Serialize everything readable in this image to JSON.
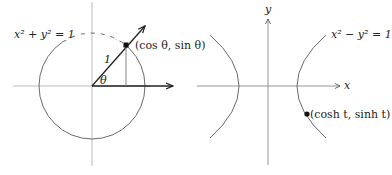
{
  "left_figure": {
    "circle_equation": "x² + y² = 1",
    "radius_label": "1",
    "angle_label": "θ",
    "point_label": "(cos θ, sin θ)"
  },
  "right_figure": {
    "y_axis_label": "y",
    "x_axis_label": "x",
    "hyperbola_equation": "x² − y² = 1",
    "point_label": "(cosh t, sinh t)"
  },
  "colors": {
    "axis": "#9a9a9a",
    "curve": "#6a6a6a",
    "arrow": "#222222",
    "text": "#222222"
  }
}
